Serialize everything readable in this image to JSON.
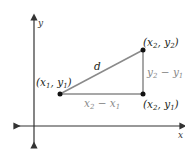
{
  "diagram": {
    "axes": {
      "x_label": "x",
      "y_label": "y"
    },
    "points": [
      {
        "id": "p1",
        "label": "(x1, y1)",
        "base": "x",
        "sub1": "1",
        "base2": "y",
        "sub2": "1"
      },
      {
        "id": "p2",
        "label": "(x2, y2)",
        "base": "x",
        "sub1": "2",
        "base2": "y",
        "sub2": "2"
      },
      {
        "id": "p3",
        "label": "(x2, y1)",
        "base": "x",
        "sub1": "2",
        "base2": "y",
        "sub2": "1"
      }
    ],
    "segments": {
      "hypotenuse_label": "d",
      "horizontal_label": "x2 − x1",
      "vertical_label": "y2 − y1"
    },
    "colors": {
      "line": "#8a8a8a",
      "axis": "#333333",
      "point": "#111111",
      "gray_text": "#8a8a8a"
    }
  }
}
